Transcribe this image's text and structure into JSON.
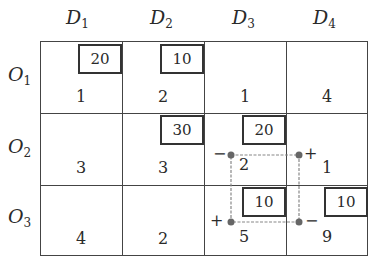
{
  "columns": [
    {
      "label": "D",
      "sub": "1"
    },
    {
      "label": "D",
      "sub": "2"
    },
    {
      "label": "D",
      "sub": "3"
    },
    {
      "label": "D",
      "sub": "4"
    }
  ],
  "rows": [
    {
      "label": "O",
      "sub": "1",
      "costs": [
        "1",
        "2",
        "1",
        "4"
      ],
      "allocations": [
        "20",
        "10",
        "",
        ""
      ]
    },
    {
      "label": "O",
      "sub": "2",
      "costs": [
        "3",
        "3",
        "2",
        "1"
      ],
      "allocations": [
        "",
        "30",
        "20",
        ""
      ]
    },
    {
      "label": "O",
      "sub": "3",
      "costs": [
        "4",
        "2",
        "5",
        "9"
      ],
      "allocations": [
        "",
        "",
        "10",
        "10"
      ]
    }
  ],
  "cycle": {
    "signs": {
      "o2d3": "−",
      "o2d4": "+",
      "o3d3": "+",
      "o3d4": "−"
    },
    "line_color": "#777777"
  }
}
